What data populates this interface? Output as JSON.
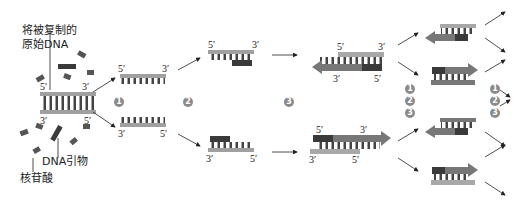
{
  "labels": {
    "template_dna_line1": "将被复制的",
    "template_dna_line2": "原始DNA",
    "primer": "DNA引物",
    "nucleotide": "核苷酸",
    "five_prime": "5′",
    "three_prime": "3′"
  },
  "steps": [
    "1",
    "2",
    "3"
  ],
  "colors": {
    "template_strand": "#a0a0a0",
    "new_strand": "#555555",
    "primer": "#3a3a3a",
    "step_marker": "#8a8a8a",
    "arrow": "#222222"
  }
}
